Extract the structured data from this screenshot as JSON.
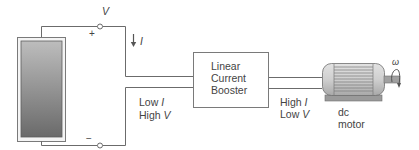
{
  "diagram": {
    "source": {
      "name": "solar panel",
      "terminal_voltage_label": "V",
      "plus_sign": "+",
      "minus_sign": "−",
      "current_label": "I"
    },
    "input_side": {
      "line1_text": "Low ",
      "line1_var": "I",
      "line2_text": "High ",
      "line2_var": "V"
    },
    "booster": {
      "line1": "Linear",
      "line2": "Current",
      "line3": "Booster"
    },
    "output_side": {
      "line1_text": "High ",
      "line1_var": "I",
      "line2_text": "Low ",
      "line2_var": "V"
    },
    "motor": {
      "line1": "dc",
      "line2": "motor",
      "speed_symbol": "ω"
    },
    "colors": {
      "line": "#6b6b6b",
      "panel_dark": "#6e6e6e",
      "panel_light": "#b8b8b8",
      "motor_body": "#c9c9c9"
    }
  }
}
